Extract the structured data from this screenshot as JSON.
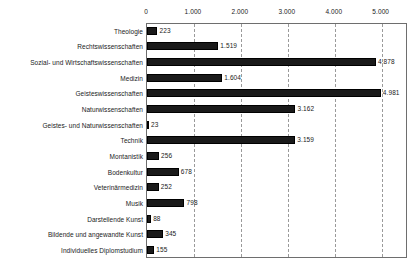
{
  "chart_data": {
    "type": "bar",
    "orientation": "horizontal",
    "title": "",
    "subtitle": "",
    "xlabel": "",
    "ylabel": "",
    "xlim": [
      0,
      5560
    ],
    "grid": true,
    "legend": null,
    "x_ticks": [
      "0",
      "1.000",
      "2.000",
      "3.000",
      "4.000",
      "5.000"
    ],
    "x_tick_values": [
      0,
      1000,
      2000,
      3000,
      4000,
      5000
    ],
    "categories": [
      "Theologie",
      "Rechtswissenschaften",
      "Sozial- und Wirtschaftswissenschaften",
      "Medizin",
      "Geisteswissenschaften",
      "Naturwissenschaften",
      "Geistes- und Naturwissenschaften",
      "Technik",
      "Montanistik",
      "Bodenkultur",
      "Veterinärmedizin",
      "Musik",
      "Darstellende Kunst",
      "Bildende und angewandte Kunst",
      "Individuelles Diplomstudium"
    ],
    "values": [
      223,
      1519,
      4878,
      1604,
      4981,
      3162,
      23,
      3159,
      256,
      678,
      252,
      798,
      88,
      345,
      155
    ],
    "value_labels": [
      "223",
      "1.519",
      "4.878",
      "1.604",
      "4.981",
      "3.162",
      "23",
      "3.159",
      "256",
      "678",
      "252",
      "798",
      "88",
      "345",
      "155"
    ],
    "bar_color": "#1a1a1a"
  },
  "axis": {
    "ticks": [
      "0",
      "1.000",
      "2.000",
      "3.000",
      "4.000",
      "5.000"
    ]
  }
}
